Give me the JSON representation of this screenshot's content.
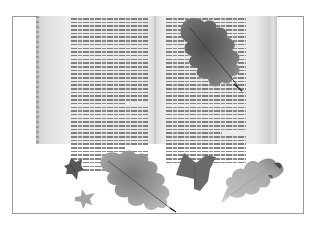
{
  "image": {
    "description": "Grayscale photograph of an open book with pressed autumn leaves, inside a thin rectangular frame",
    "frame_color": "#9a9a9a",
    "background": "#ffffff"
  },
  "book": {
    "left_page": {
      "text_lines": 42,
      "paragraph_breaks": [
        24,
        36
      ]
    },
    "right_page": {
      "text_lines": 40,
      "paragraph_breaks": [
        32
      ]
    },
    "page_text_legible": false
  },
  "leaves": [
    {
      "name": "oak-leaf-on-book",
      "kind": "oak",
      "tone": "#6e6e6e"
    },
    {
      "name": "small-ivy-leaf-dark",
      "kind": "ivy",
      "tone": "#5a5a5a"
    },
    {
      "name": "small-ivy-leaf-light",
      "kind": "ivy",
      "tone": "#a3a3a3"
    },
    {
      "name": "large-oak-leaf",
      "kind": "oak",
      "tone": "#9a9a9a"
    },
    {
      "name": "ivy-leaf-dark",
      "kind": "ivy",
      "tone": "#6a6a6a"
    },
    {
      "name": "oak-leaf-light",
      "kind": "oak",
      "tone": "#b2b2b2"
    }
  ]
}
